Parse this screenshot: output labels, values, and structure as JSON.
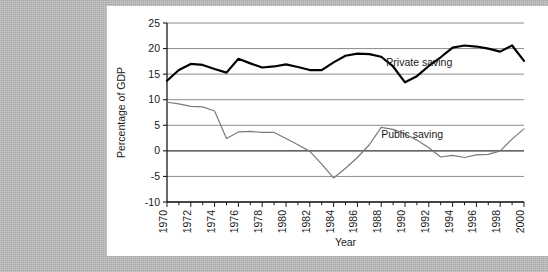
{
  "figure": {
    "background_color": "#b4b4b4",
    "panel_color": "#ffffff"
  },
  "chart_data": {
    "type": "line",
    "title": "",
    "xlabel": "Year",
    "ylabel": "Percentage of GDP",
    "xlim": [
      1970,
      2000
    ],
    "ylim": [
      -10,
      25
    ],
    "ytick_labels": [
      "25",
      "20",
      "15",
      "10",
      "5",
      "0",
      "-5",
      "-10"
    ],
    "ytick_values": [
      25,
      20,
      15,
      10,
      5,
      0,
      -5,
      -10
    ],
    "xtick_labels": [
      "1970",
      "1972",
      "1974",
      "1976",
      "1978",
      "1980",
      "1982",
      "1984",
      "1986",
      "1988",
      "1990",
      "1992",
      "1994",
      "1996",
      "1998",
      "2000"
    ],
    "xtick_values": [
      1970,
      1972,
      1974,
      1976,
      1978,
      1980,
      1982,
      1984,
      1986,
      1988,
      1990,
      1992,
      1994,
      1996,
      1998,
      2000
    ],
    "xtick_rotation": 90,
    "minor_xticks_every": 1,
    "grid": true,
    "grid_color": "#808080",
    "zero_line": true,
    "zero_line_color": "#333333",
    "legend": "inline-annotations",
    "x": [
      1970,
      1971,
      1972,
      1973,
      1974,
      1975,
      1976,
      1977,
      1978,
      1979,
      1980,
      1981,
      1982,
      1983,
      1984,
      1985,
      1986,
      1987,
      1988,
      1989,
      1990,
      1991,
      1992,
      1993,
      1994,
      1995,
      1996,
      1997,
      1998,
      1999,
      2000
    ],
    "series": [
      {
        "name": "Private saving",
        "color": "#000000",
        "line_width": 2.2,
        "label_text": "Private saving",
        "label_x": 1991.2,
        "label_y": 16.6,
        "values": [
          13.7,
          15.8,
          17.0,
          16.8,
          16.0,
          15.3,
          18.0,
          17.1,
          16.3,
          16.5,
          16.9,
          16.4,
          15.8,
          15.8,
          17.3,
          18.6,
          19.0,
          18.9,
          18.4,
          16.5,
          13.4,
          14.6,
          16.6,
          18.3,
          20.2,
          20.6,
          20.4,
          20.0,
          19.4,
          20.6,
          17.6
        ]
      },
      {
        "name": "Public saving",
        "color": "#7a7a7a",
        "line_width": 1.2,
        "label_text": "Public saving",
        "label_x": 1990.6,
        "label_y": 2.6,
        "values": [
          9.5,
          9.2,
          8.7,
          8.6,
          7.8,
          2.4,
          3.7,
          3.8,
          3.6,
          3.6,
          2.4,
          1.2,
          -0.1,
          -2.6,
          -5.3,
          -3.4,
          -1.3,
          1.2,
          4.6,
          4.2,
          3.3,
          2.1,
          0.6,
          -1.2,
          -0.9,
          -1.3,
          -0.8,
          -0.7,
          0.0,
          2.3,
          4.3
        ]
      }
    ],
    "annotations": [
      {
        "text": "Private saving",
        "x": 1991.2,
        "y": 16.6
      },
      {
        "text": "Public saving",
        "x": 1990.6,
        "y": 2.6
      }
    ]
  }
}
